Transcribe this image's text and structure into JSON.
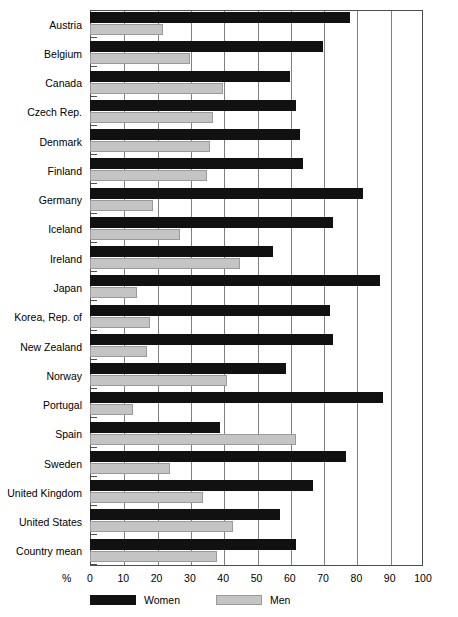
{
  "chart_data": {
    "type": "bar",
    "orientation": "horizontal",
    "title": "",
    "xlabel": "%",
    "ylabel": "",
    "xlim": [
      0,
      100
    ],
    "xticks": [
      0,
      10,
      20,
      30,
      40,
      50,
      60,
      70,
      80,
      90,
      100
    ],
    "xtick_labels": [
      "0",
      "10",
      "20",
      "30",
      "40",
      "50",
      "60",
      "70",
      "80",
      "90",
      "100"
    ],
    "grid": true,
    "legend_position": "bottom-left",
    "categories": [
      "Austria",
      "Belgium",
      "Canada",
      "Czech Rep.",
      "Denmark",
      "Finland",
      "Germany",
      "Iceland",
      "Ireland",
      "Japan",
      "Korea, Rep. of",
      "New Zealand",
      "Norway",
      "Portugal",
      "Spain",
      "Sweden",
      "United Kingdom",
      "United States",
      "Country mean"
    ],
    "series": [
      {
        "name": "Women",
        "color": "#111111",
        "values": [
          78,
          70,
          60,
          62,
          63,
          64,
          82,
          73,
          55,
          87,
          72,
          73,
          59,
          88,
          39,
          77,
          67,
          57,
          62
        ]
      },
      {
        "name": "Men",
        "color": "#c4c4c4",
        "values": [
          22,
          30,
          40,
          37,
          36,
          35,
          19,
          27,
          45,
          14,
          18,
          17,
          41,
          13,
          62,
          24,
          34,
          43,
          38
        ]
      }
    ]
  },
  "axis": {
    "percent_symbol": "%"
  },
  "legend": {
    "items": [
      {
        "label": "Women",
        "swatch": "women"
      },
      {
        "label": "Men",
        "swatch": "men"
      }
    ]
  }
}
